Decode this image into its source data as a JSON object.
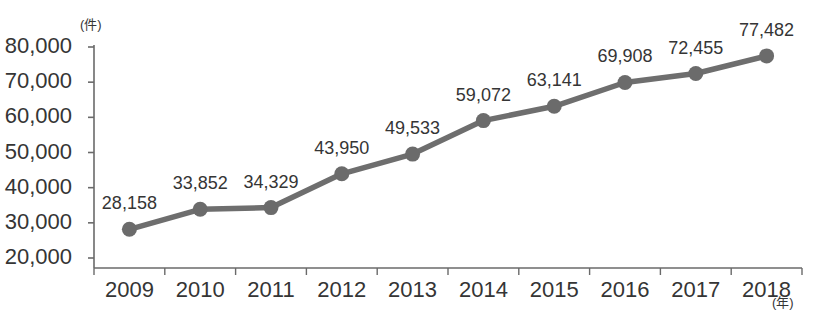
{
  "chart_data": {
    "type": "line",
    "title": "",
    "subtitle": "",
    "xlabel": "(年)",
    "ylabel": "(件)",
    "categories": [
      "2009",
      "2010",
      "2011",
      "2012",
      "2013",
      "2014",
      "2015",
      "2016",
      "2017",
      "2018"
    ],
    "values": [
      28158,
      33852,
      34329,
      43950,
      49533,
      59072,
      63141,
      69908,
      72455,
      77482
    ],
    "point_labels": [
      "28,158",
      "33,852",
      "34,329",
      "43,950",
      "49,533",
      "59,072",
      "63,141",
      "69,908",
      "72,455",
      "77,482"
    ],
    "ylim": [
      20000,
      80000
    ],
    "ytick_values": [
      80000,
      70000,
      60000,
      50000,
      40000,
      30000,
      20000
    ],
    "ytick_labels": [
      "80,000",
      "70,000",
      "60,000",
      "50,000",
      "40,000",
      "30,000",
      "20,000"
    ],
    "grid": false,
    "legend": false,
    "legend_position": "none",
    "series": [
      {
        "name": "",
        "values": [
          28158,
          33852,
          34329,
          43950,
          49533,
          59072,
          63141,
          69908,
          72455,
          77482
        ]
      }
    ],
    "colors": {
      "line": "#6e6e6e",
      "marker": "#6b6b6b",
      "axis": "#6a6a6a",
      "text": "#353535",
      "background": "#ffffff"
    }
  }
}
